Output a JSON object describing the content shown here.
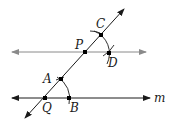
{
  "diagram": {
    "type": "geometry-construction",
    "colors": {
      "line_m": "#1a1a1a",
      "parallel_line": "#8a8a8a",
      "transversal": "#1a1a1a",
      "points": "#000000"
    },
    "lines": [
      {
        "name": "m",
        "label": "m",
        "from": [
          12,
          98
        ],
        "to": [
          150,
          98
        ],
        "arrows": "both"
      },
      {
        "name": "parallel",
        "label": "",
        "from": [
          12,
          52
        ],
        "to": [
          146,
          52
        ],
        "arrows": "both"
      },
      {
        "name": "transversal",
        "label": "",
        "from": [
          25,
          118
        ],
        "to": [
          124,
          9
        ],
        "arrows": "both"
      }
    ],
    "points": [
      {
        "label": "Q",
        "x": 45,
        "y": 98
      },
      {
        "label": "B",
        "x": 69,
        "y": 98
      },
      {
        "label": "A",
        "x": 61,
        "y": 79
      },
      {
        "label": "P",
        "x": 85,
        "y": 52
      },
      {
        "label": "C",
        "x": 101,
        "y": 35
      },
      {
        "label": "D",
        "x": 109,
        "y": 53
      }
    ],
    "labels": {
      "Q": "Q",
      "B": "B",
      "A": "A",
      "P": "P",
      "C": "C",
      "D": "D",
      "m": "m"
    }
  }
}
